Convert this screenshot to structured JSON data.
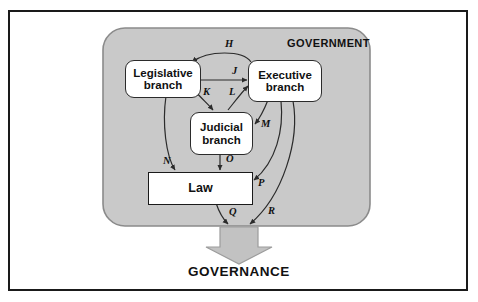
{
  "diagram": {
    "outer_frame": {
      "border_color": "#1a1a1a",
      "background": "#ffffff"
    },
    "panel": {
      "label": "GOVERNMENT",
      "fill": "#c9c9c9",
      "stroke": "#8a8a8a"
    },
    "nodes": [
      {
        "id": "legislative",
        "label": "Legislative\nbranch",
        "line1": "Legislative",
        "line2": "branch",
        "shape": "rounded",
        "fill": "#ffffff"
      },
      {
        "id": "executive",
        "label": "Executive\nbranch",
        "line1": "Executive",
        "line2": "branch",
        "shape": "rounded",
        "fill": "#ffffff"
      },
      {
        "id": "judicial",
        "label": "Judicial\nbranch",
        "line1": "Judicial",
        "line2": "branch",
        "shape": "rounded",
        "fill": "#ffffff"
      },
      {
        "id": "law",
        "label": "Law",
        "line1": "Law",
        "line2": "",
        "shape": "rectangle",
        "fill": "#ffffff"
      }
    ],
    "edge_labels": [
      {
        "id": "H",
        "text": "H",
        "from": "executive",
        "to": "legislative"
      },
      {
        "id": "J",
        "text": "J",
        "from": "legislative",
        "to": "executive"
      },
      {
        "id": "K",
        "text": "K",
        "from": "legislative",
        "to": "judicial"
      },
      {
        "id": "L",
        "text": "L",
        "from": "judicial",
        "to": "executive"
      },
      {
        "id": "M",
        "text": "M",
        "from": "executive",
        "to": "judicial"
      },
      {
        "id": "N",
        "text": "N",
        "from": "legislative",
        "to": "law"
      },
      {
        "id": "O",
        "text": "O",
        "from": "judicial",
        "to": "law"
      },
      {
        "id": "P",
        "text": "P",
        "from": "executive",
        "to": "law"
      },
      {
        "id": "Q",
        "text": "Q",
        "from": "law",
        "to": "governance"
      },
      {
        "id": "R",
        "text": "R",
        "from": "executive",
        "to": "governance"
      }
    ],
    "output": {
      "label": "GOVERNANCE",
      "arrow_fill": "#c2c2c2",
      "arrow_stroke": "#9a9a9a"
    }
  }
}
